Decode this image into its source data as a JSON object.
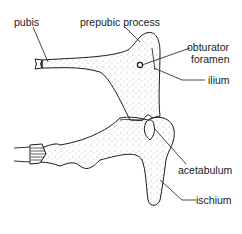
{
  "figure": {
    "labels": {
      "pubis": "pubis",
      "prepubic_process": "prepubic process",
      "obturator_foramen_line1": "obturator",
      "obturator_foramen_line2": "foramen",
      "ilium": "ilium",
      "acetabulum": "acetabulum",
      "ischium": "ischium"
    },
    "colors": {
      "ink": "#1a1a1a",
      "stipple": "#555555",
      "background": "#ffffff"
    }
  }
}
